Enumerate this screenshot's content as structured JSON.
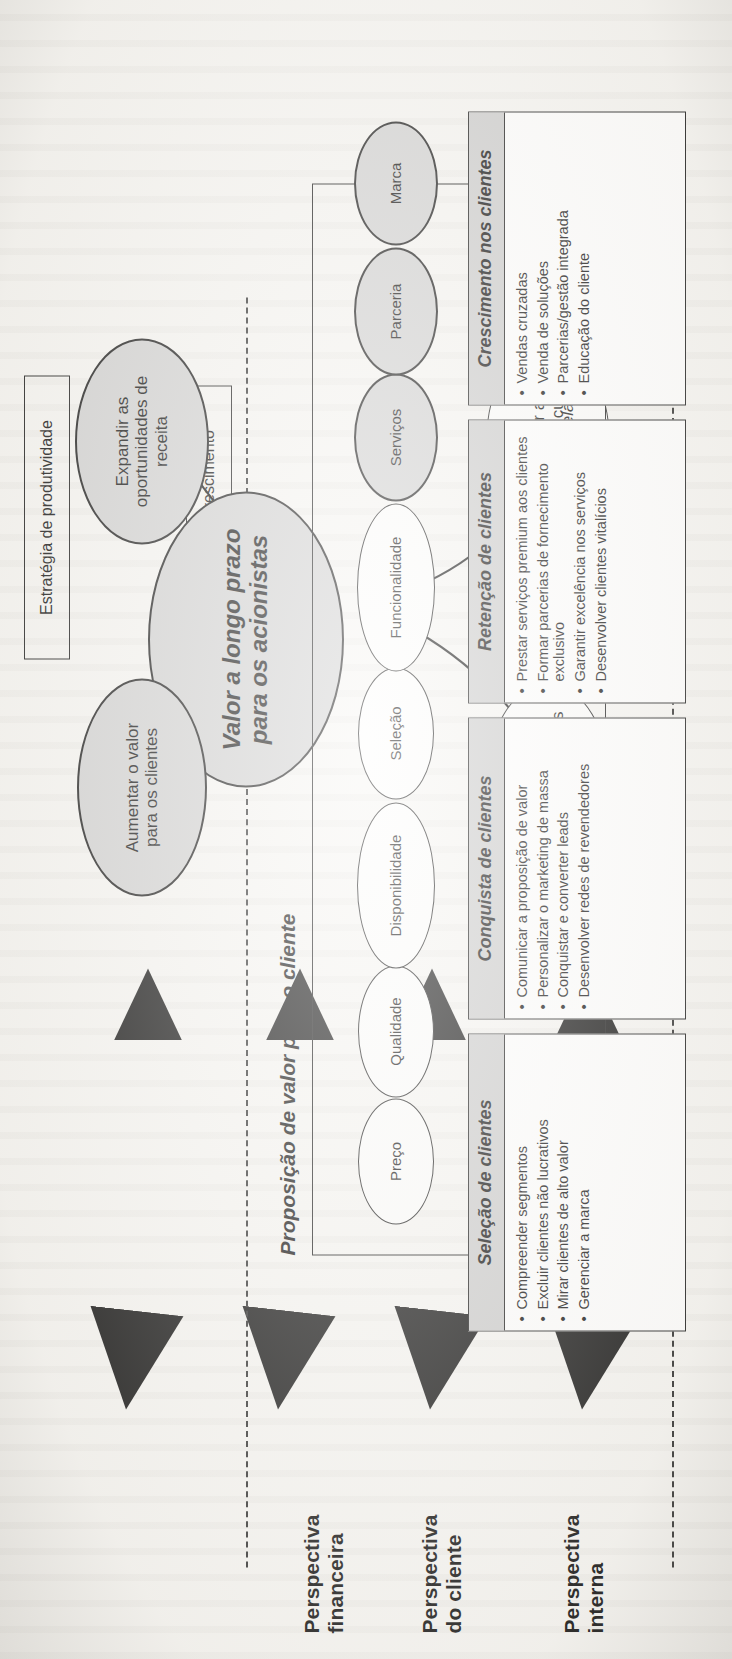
{
  "perspectives": [
    {
      "id": "financeira",
      "line1": "Perspectiva",
      "line2": "financeira"
    },
    {
      "id": "cliente",
      "line1": "Perspectiva",
      "line2": "do cliente"
    },
    {
      "id": "interna",
      "line1": "Perspectiva",
      "line2": "interna"
    }
  ],
  "financial": {
    "strategy_boxes": [
      {
        "id": "produtividade",
        "label": "Estratégia de produtividade"
      },
      {
        "id": "crescimento",
        "label": "Estratégia de crescimento"
      }
    ],
    "core_objective": "Valor a longo prazo\npara os acionistas",
    "core_objective_line1": "Valor a longo prazo",
    "core_objective_line2": "para os acionistas",
    "objectives": [
      {
        "id": "melhorar-custos",
        "line1": "Melhorar a",
        "line2": "estrutura de custos",
        "style": "white"
      },
      {
        "id": "aumentar-ativos",
        "line1": "Aumentar a",
        "line2": "utilização dos ativos",
        "style": "white"
      },
      {
        "id": "expandir-receita",
        "line1": "Expandir as",
        "line2": "oportunidades de",
        "line3": "receita",
        "style": "shaded"
      },
      {
        "id": "aumentar-valor",
        "line1": "Aumentar o valor",
        "line2": "para os clientes",
        "style": "shaded"
      }
    ]
  },
  "customer": {
    "value_proposition_title": "Proposição de valor para o cliente",
    "groups": [
      {
        "id": "atributos",
        "label": "Atributos do produto/serviço"
      },
      {
        "id": "relacionamento",
        "label": "Relacionamento"
      },
      {
        "id": "imagem",
        "label": "Imagem"
      }
    ],
    "items": [
      {
        "id": "preco",
        "label": "Preço",
        "style": "white"
      },
      {
        "id": "qualidade",
        "label": "Qualidade",
        "style": "white"
      },
      {
        "id": "disponibilidade",
        "label": "Disponibilidade",
        "style": "white"
      },
      {
        "id": "selecao",
        "label": "Seleção",
        "style": "white"
      },
      {
        "id": "funcionalidade",
        "label": "Funcionalidade",
        "style": "white"
      },
      {
        "id": "servicos",
        "label": "Serviços",
        "style": "shaded"
      },
      {
        "id": "parceria",
        "label": "Parceria",
        "style": "shaded"
      },
      {
        "id": "marca",
        "label": "Marca",
        "style": "shaded"
      }
    ]
  },
  "internal": {
    "processes": [
      {
        "id": "selecao-de-clientes",
        "title": "Seleção de clientes",
        "bullets": [
          "Compreender segmentos",
          "Excluir clientes não lucrativos",
          "Mirar clientes de alto valor",
          "Gerenciar a marca"
        ]
      },
      {
        "id": "conquista-de-clientes",
        "title": "Conquista de clientes",
        "bullets": [
          "Comunicar a proposição de valor",
          "Personalizar o marketing de massa",
          "Conquistar e converter leads",
          "Desenvolver redes de revendedores"
        ]
      },
      {
        "id": "retencao-de-clientes",
        "title": "Retenção de clientes",
        "bullets": [
          "Prestar serviços premium aos clientes",
          "Formar parcerias de fornecimento exclusivo",
          "Garantir excelência nos serviços",
          "Desenvolver clientes vitalícios"
        ]
      },
      {
        "id": "crescimento-nos-clientes",
        "title": "Crescimento nos clientes",
        "bullets": [
          "Vendas cruzadas",
          "Venda de soluções",
          "Parcerias/gestão integrada",
          "Educação do cliente"
        ]
      }
    ]
  },
  "colors": {
    "shaded_fill": "#d2d2d2",
    "header_fill": "#cdcdcd",
    "stroke": "#1c1c1c",
    "page": "#f7f6f3"
  }
}
